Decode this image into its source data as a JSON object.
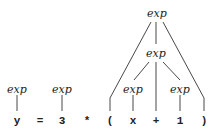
{
  "diagram": {
    "type": "parse-tree",
    "nonterminal_label": "exp",
    "tokens": [
      "y",
      "=",
      "3",
      "*",
      "(",
      "x",
      "+",
      "1",
      ")"
    ],
    "nodes": {
      "root": "exp",
      "inner": "exp",
      "leaf_y": "exp",
      "leaf_3": "exp",
      "leaf_x": "exp",
      "leaf_1": "exp"
    },
    "edges": [
      [
        "leaf_y",
        "y"
      ],
      [
        "leaf_3",
        "3"
      ],
      [
        "root",
        "("
      ],
      [
        "root",
        "inner"
      ],
      [
        "root",
        ")"
      ],
      [
        "inner",
        "leaf_x"
      ],
      [
        "inner",
        "+"
      ],
      [
        "inner",
        "leaf_1"
      ],
      [
        "leaf_x",
        "x"
      ],
      [
        "leaf_1",
        "1"
      ]
    ]
  }
}
